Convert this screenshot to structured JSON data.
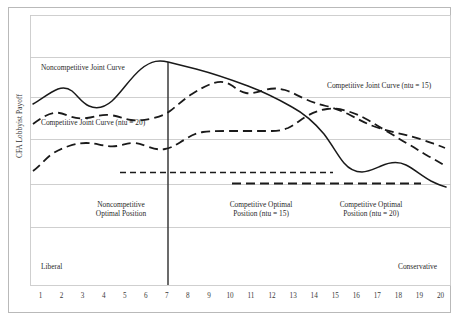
{
  "figure": {
    "background": "#ffffff",
    "frame_color": "#b9b9b9",
    "grid_color": "#c9c9c9",
    "curve_color": "#1a1a1a"
  },
  "axis": {
    "ylabel": "CFA Lobbyist Payoff",
    "xticks": [
      "1",
      "2",
      "3",
      "4",
      "5",
      "6",
      "7",
      "8",
      "9",
      "10",
      "11",
      "12",
      "13",
      "14",
      "15",
      "16",
      "17",
      "18",
      "19",
      "20"
    ]
  },
  "annotations": {
    "noncompetitive_joint_curve": "Noncompetitive Joint Curve",
    "competitive_joint_curve_20": "Competitive Joint Curve (ntu = 20)",
    "competitive_joint_curve_15": "Competitive Joint Curve (ntu = 15)",
    "noncompetitive_optimal_line1": "Noncompetitive",
    "noncompetitive_optimal_line2": "Optimal Position",
    "competitive_optimal_15_line1": "Competitive Optimal",
    "competitive_optimal_15_line2": "Position (ntu = 15)",
    "competitive_optimal_20_line1": "Competitive Optimal",
    "competitive_optimal_20_line2": "Position (ntu = 20)",
    "liberal": "Liberal",
    "conservative": "Conservative"
  },
  "chart_data": {
    "type": "line",
    "title": "",
    "xlabel": "",
    "ylabel": "CFA Lobbyist Payoff",
    "xlim": [
      1,
      20
    ],
    "ylim": [
      0,
      10
    ],
    "grid": true,
    "legend": "inline-annotations",
    "x": [
      1,
      2,
      3,
      4,
      5,
      6,
      7,
      8,
      9,
      10,
      11,
      12,
      13,
      14,
      15,
      16,
      17,
      18,
      19,
      20
    ],
    "series": [
      {
        "name": "Noncompetitive Joint Curve",
        "style": "solid",
        "values": [
          6.3,
          6.7,
          6.95,
          6.8,
          6.55,
          6.6,
          7.35,
          8.25,
          8.05,
          7.8,
          7.55,
          7.3,
          7.0,
          6.7,
          6.35,
          5.95,
          5.1,
          4.2,
          3.95,
          3.1
        ]
      },
      {
        "name": "Competitive Joint Curve (ntu = 15)",
        "style": "dashed",
        "values": [
          5.3,
          5.85,
          5.95,
          5.8,
          5.75,
          5.8,
          5.8,
          6.15,
          6.55,
          6.95,
          7.25,
          7.1,
          7.2,
          7.15,
          6.75,
          6.3,
          6.1,
          5.95,
          5.65,
          5.4
        ]
      },
      {
        "name": "Competitive Joint Curve (ntu = 20)",
        "style": "dashed",
        "values": [
          3.45,
          4.15,
          4.7,
          4.6,
          4.8,
          4.6,
          4.85,
          5.35,
          5.6,
          5.65,
          5.65,
          5.65,
          5.7,
          6.3,
          6.55,
          6.35,
          6.0,
          5.55,
          5.05,
          4.55
        ]
      },
      {
        "name": "Noncompetitive Optimal Position level",
        "style": "dashed-flat",
        "x_range": [
          5,
          15
        ],
        "value": 2.55
      },
      {
        "name": "Competitive Optimal Position level",
        "style": "dashed-flat",
        "x_range": [
          10.5,
          19.6
        ],
        "value": 2.0
      }
    ],
    "vertical_marker": {
      "x": 7.45,
      "label": "Noncompetitive Optimal Position",
      "color": "#3a3a3a"
    },
    "region_labels": [
      {
        "text": "Noncompetitive Optimal Position",
        "x_center": 4.2
      },
      {
        "text": "Competitive Optimal Position (ntu = 15)",
        "x_center": 11.3
      },
      {
        "text": "Competitive Optimal Position (ntu = 20)",
        "x_center": 16.1
      }
    ],
    "axis_endpoints": {
      "left": "Liberal",
      "right": "Conservative"
    }
  }
}
